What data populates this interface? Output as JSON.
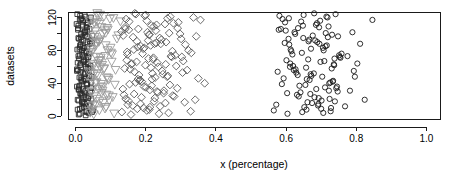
{
  "chart_data": {
    "type": "scatter",
    "title": "",
    "xlabel": "x (percentage)",
    "ylabel": "datasets",
    "xlim": [
      -0.02,
      1.04
    ],
    "ylim": [
      -4,
      126
    ],
    "grid": false,
    "legend": "none",
    "background": "#ffffff",
    "box": true,
    "xticks": [
      0.0,
      0.2,
      0.4,
      0.6,
      0.8,
      1.0
    ],
    "xtick_labels": [
      "0.0",
      "0.2",
      "0.4",
      "0.6",
      "0.8",
      "1.0"
    ],
    "yticks": [
      0,
      40,
      80,
      120
    ],
    "ytick_labels": [
      "0",
      "40",
      "80",
      "120"
    ],
    "yticks_minor": [
      20,
      60,
      100
    ],
    "series": [
      {
        "name": "squares",
        "marker": "square",
        "color": "#2b2b2b",
        "x": [
          0.012,
          0.031,
          0.006,
          0.024,
          0.041,
          0.018,
          0.009,
          0.036,
          0.021,
          0.014,
          0.028,
          0.045,
          0.004,
          0.033,
          0.017,
          0.026,
          0.011,
          0.039,
          0.022,
          0.007,
          0.03,
          0.043,
          0.015,
          0.025,
          0.01,
          0.037,
          0.019,
          0.029,
          0.005,
          0.034,
          0.013,
          0.047,
          0.023,
          0.008,
          0.032,
          0.016,
          0.027,
          0.04,
          0.02,
          0.003,
          0.035,
          0.012,
          0.044,
          0.026,
          0.009,
          0.031,
          0.018,
          0.038,
          0.024,
          0.006,
          0.029,
          0.014,
          0.042,
          0.021,
          0.011,
          0.033,
          0.017,
          0.046,
          0.027,
          0.004,
          0.036,
          0.013,
          0.022,
          0.03,
          0.008,
          0.04,
          0.019,
          0.025,
          0.015,
          0.034,
          0.01,
          0.048,
          0.023,
          0.007,
          0.032,
          0.02,
          0.043,
          0.016,
          0.028,
          0.005,
          0.037,
          0.012,
          0.026,
          0.045,
          0.018,
          0.009,
          0.031,
          0.022,
          0.039,
          0.014,
          0.029,
          0.006,
          0.035,
          0.024,
          0.011,
          0.041,
          0.017,
          0.027,
          0.033,
          0.008,
          0.021,
          0.013,
          0.05,
          0.03,
          0.019,
          0.038,
          0.025,
          0.01,
          0.044,
          0.016,
          0.028,
          0.004,
          0.036,
          0.023,
          0.012,
          0.032,
          0.02,
          0.042,
          0.015,
          0.026,
          0.007,
          0.034,
          0.018,
          0.029,
          0.047,
          0.022,
          0.009,
          0.04,
          0.013,
          0.031
        ],
        "y": [
          3,
          5,
          8,
          11,
          14,
          17,
          19,
          22,
          25,
          28,
          31,
          34,
          36,
          39,
          42,
          45,
          47,
          50,
          53,
          56,
          58,
          61,
          64,
          67,
          70,
          72,
          75,
          78,
          81,
          84,
          86,
          89,
          92,
          95,
          97,
          100,
          103,
          106,
          109,
          112,
          114,
          117,
          120,
          123,
          2,
          6,
          10,
          13,
          16,
          20,
          23,
          27,
          30,
          33,
          37,
          40,
          44,
          48,
          51,
          55,
          59,
          62,
          66,
          69,
          73,
          76,
          80,
          83,
          87,
          90,
          94,
          98,
          101,
          105,
          108,
          111,
          115,
          118,
          121,
          124,
          4,
          9,
          15,
          21,
          26,
          32,
          38,
          43,
          49,
          54,
          60,
          65,
          71,
          77,
          82,
          88,
          93,
          99,
          104,
          110,
          116,
          122,
          7,
          12,
          18,
          24,
          29,
          35,
          41,
          46,
          52,
          57,
          63,
          68,
          74,
          79,
          85,
          91,
          96,
          102,
          107,
          113,
          119,
          1,
          5,
          17,
          33,
          58,
          84,
          111
        ]
      },
      {
        "name": "triangles",
        "marker": "triangle-down",
        "color": "#9a9a9a",
        "x": [
          0.052,
          0.068,
          0.041,
          0.079,
          0.06,
          0.088,
          0.047,
          0.073,
          0.056,
          0.094,
          0.064,
          0.038,
          0.082,
          0.05,
          0.071,
          0.059,
          0.101,
          0.044,
          0.086,
          0.067,
          0.055,
          0.077,
          0.092,
          0.048,
          0.062,
          0.108,
          0.07,
          0.042,
          0.084,
          0.058,
          0.096,
          0.053,
          0.075,
          0.065,
          0.112,
          0.046,
          0.089,
          0.061,
          0.08,
          0.051,
          0.103,
          0.072,
          0.043,
          0.091,
          0.057,
          0.066,
          0.118,
          0.049,
          0.083,
          0.074,
          0.054,
          0.098,
          0.063,
          0.04,
          0.087,
          0.069,
          0.106,
          0.045,
          0.078,
          0.06,
          0.093,
          0.052,
          0.114,
          0.076,
          0.066,
          0.085,
          0.047,
          0.1,
          0.058,
          0.071,
          0.122,
          0.056,
          0.09,
          0.068,
          0.039,
          0.081,
          0.062,
          0.11,
          0.05,
          0.095,
          0.073,
          0.044,
          0.064,
          0.104,
          0.059,
          0.086,
          0.128,
          0.048,
          0.077,
          0.07
        ],
        "y": [
          2,
          7,
          12,
          16,
          21,
          26,
          30,
          35,
          40,
          44,
          49,
          54,
          58,
          63,
          68,
          72,
          77,
          82,
          86,
          91,
          96,
          100,
          105,
          110,
          114,
          119,
          123,
          4,
          9,
          14,
          19,
          24,
          28,
          33,
          38,
          43,
          47,
          52,
          57,
          61,
          66,
          71,
          76,
          80,
          85,
          90,
          94,
          99,
          104,
          108,
          113,
          118,
          122,
          6,
          11,
          18,
          23,
          29,
          36,
          41,
          46,
          51,
          56,
          62,
          67,
          73,
          78,
          83,
          88,
          93,
          98,
          103,
          107,
          112,
          116,
          121,
          125,
          3,
          13,
          25,
          39,
          53,
          64,
          75,
          89,
          101,
          115,
          8,
          31,
          60
        ]
      },
      {
        "name": "diamonds",
        "marker": "diamond",
        "color": "#5a5a5a",
        "x": [
          0.132,
          0.158,
          0.176,
          0.149,
          0.203,
          0.224,
          0.188,
          0.241,
          0.167,
          0.256,
          0.212,
          0.143,
          0.277,
          0.195,
          0.232,
          0.171,
          0.29,
          0.218,
          0.154,
          0.263,
          0.182,
          0.305,
          0.227,
          0.14,
          0.249,
          0.199,
          0.318,
          0.174,
          0.236,
          0.208,
          0.161,
          0.284,
          0.221,
          0.147,
          0.272,
          0.193,
          0.33,
          0.214,
          0.166,
          0.258,
          0.186,
          0.301,
          0.23,
          0.136,
          0.245,
          0.205,
          0.344,
          0.179,
          0.267,
          0.216,
          0.152,
          0.293,
          0.223,
          0.144,
          0.279,
          0.197,
          0.356,
          0.169,
          0.238,
          0.21,
          0.163,
          0.311,
          0.226,
          0.138,
          0.252,
          0.201,
          0.368,
          0.184,
          0.261,
          0.219,
          0.156,
          0.287,
          0.233,
          0.146,
          0.274,
          0.191,
          0.322,
          0.177,
          0.243,
          0.207,
          0.164,
          0.298,
          0.229,
          0.141,
          0.255,
          0.203,
          0.336,
          0.172,
          0.265,
          0.212,
          0.15,
          0.281,
          0.235,
          0.135,
          0.269,
          0.189,
          0.35,
          0.181,
          0.247,
          0.215,
          0.159,
          0.307,
          0.222,
          0.148,
          0.276,
          0.196,
          0.313,
          0.175,
          0.24,
          0.209,
          0.131,
          0.291,
          0.231,
          0.153,
          0.262,
          0.2,
          0.328,
          0.185,
          0.251,
          0.217,
          0.168,
          0.303,
          0.225,
          0.142,
          0.27,
          0.194,
          0.341,
          0.178,
          0.257,
          0.211
        ],
        "y": [
          5,
          2,
          9,
          14,
          7,
          18,
          23,
          12,
          27,
          16,
          32,
          21,
          25,
          36,
          30,
          41,
          34,
          45,
          39,
          49,
          43,
          53,
          47,
          58,
          51,
          62,
          56,
          66,
          60,
          70,
          64,
          74,
          69,
          78,
          73,
          82,
          77,
          86,
          81,
          90,
          85,
          94,
          89,
          98,
          93,
          102,
          97,
          106,
          101,
          110,
          105,
          114,
          109,
          118,
          113,
          122,
          117,
          125,
          3,
          8,
          13,
          17,
          22,
          26,
          31,
          35,
          40,
          44,
          48,
          52,
          57,
          61,
          65,
          68,
          72,
          76,
          80,
          84,
          88,
          92,
          96,
          100,
          104,
          108,
          112,
          116,
          120,
          124,
          4,
          11,
          19,
          24,
          29,
          33,
          38,
          42,
          46,
          50,
          55,
          59,
          63,
          67,
          71,
          75,
          79,
          83,
          87,
          91,
          95,
          99,
          103,
          107,
          111,
          115,
          119,
          123,
          6,
          15,
          28,
          37,
          54,
          72,
          88,
          106,
          121,
          10,
          20,
          45,
          63,
          99
        ]
      },
      {
        "name": "circles",
        "marker": "circle",
        "color": "#1a1a1a",
        "x": [
          0.572,
          0.604,
          0.631,
          0.588,
          0.658,
          0.679,
          0.612,
          0.701,
          0.645,
          0.722,
          0.596,
          0.667,
          0.713,
          0.627,
          0.688,
          0.738,
          0.581,
          0.652,
          0.705,
          0.719,
          0.636,
          0.694,
          0.745,
          0.608,
          0.672,
          0.727,
          0.62,
          0.683,
          0.751,
          0.599,
          0.661,
          0.716,
          0.641,
          0.697,
          0.733,
          0.576,
          0.676,
          0.709,
          0.648,
          0.724,
          0.615,
          0.686,
          0.741,
          0.593,
          0.664,
          0.73,
          0.624,
          0.691,
          0.755,
          0.607,
          0.655,
          0.718,
          0.633,
          0.7,
          0.736,
          0.585,
          0.669,
          0.712,
          0.643,
          0.726,
          0.618,
          0.681,
          0.748,
          0.601,
          0.674,
          0.721,
          0.629,
          0.695,
          0.743,
          0.59,
          0.659,
          0.707,
          0.646,
          0.731,
          0.611,
          0.685,
          0.753,
          0.603,
          0.666,
          0.715,
          0.638,
          0.698,
          0.739,
          0.579,
          0.671,
          0.703,
          0.65,
          0.728,
          0.622,
          0.689,
          0.747,
          0.597,
          0.663,
          0.734,
          0.626,
          0.693,
          0.758,
          0.609,
          0.657,
          0.711,
          0.782,
          0.796,
          0.811,
          0.768,
          0.803,
          0.789,
          0.824,
          0.775,
          0.846,
          0.793,
          0.565,
          0.634,
          0.706,
          0.68,
          0.723,
          0.649,
          0.692,
          0.737,
          0.613,
          0.67
        ],
        "y": [
          14,
          3,
          26,
          39,
          8,
          52,
          64,
          19,
          77,
          31,
          89,
          44,
          101,
          57,
          113,
          70,
          122,
          11,
          83,
          96,
          24,
          108,
          36,
          119,
          49,
          6,
          61,
          92,
          74,
          104,
          17,
          86,
          29,
          116,
          42,
          54,
          98,
          67,
          110,
          21,
          79,
          33,
          124,
          46,
          91,
          58,
          102,
          13,
          71,
          94,
          38,
          120,
          50,
          9,
          63,
          106,
          27,
          85,
          115,
          41,
          75,
          23,
          97,
          68,
          16,
          109,
          53,
          88,
          34,
          118,
          45,
          80,
          5,
          99,
          60,
          111,
          72,
          28,
          93,
          121,
          37,
          66,
          18,
          105,
          82,
          48,
          123,
          10,
          56,
          90,
          30,
          114,
          69,
          43,
          100,
          22,
          76,
          87,
          59,
          35,
          31,
          48,
          88,
          12,
          64,
          102,
          20,
          73,
          117,
          55,
          7,
          107,
          4,
          125,
          40,
          95,
          15,
          62,
          81,
          51
        ]
      }
    ]
  },
  "axes": {
    "x_title": "x (percentage)",
    "y_title": "datasets"
  }
}
